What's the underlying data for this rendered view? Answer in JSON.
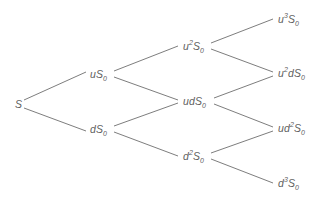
{
  "diagram": {
    "type": "tree",
    "background_color": "#ffffff",
    "edge_color": "#6e6e6e",
    "label_color": "#5e5e5e",
    "nodes": [
      {
        "id": "n0",
        "step": 0,
        "label": "S",
        "base": "S",
        "sup": "",
        "sub": "",
        "x": 15,
        "y": 104
      },
      {
        "id": "n1u",
        "step": 1,
        "label": "uS0",
        "base_italic": "u",
        "base": "S",
        "sup": "",
        "sub": "0",
        "x": 90,
        "y": 74
      },
      {
        "id": "n1d",
        "step": 1,
        "label": "dS0",
        "base_italic": "d",
        "base": "S",
        "sup": "",
        "sub": "0",
        "x": 90,
        "y": 129
      },
      {
        "id": "n2uu",
        "step": 2,
        "label": "u2S0",
        "base_italic": "u",
        "base": "S",
        "sup": "2",
        "sub": "0",
        "x": 183,
        "y": 46
      },
      {
        "id": "n2ud",
        "step": 2,
        "label": "udS0",
        "base_italic": "ud",
        "base": "S",
        "sup": "",
        "sub": "0",
        "x": 183,
        "y": 101
      },
      {
        "id": "n2dd",
        "step": 2,
        "label": "d2S0",
        "base_italic": "d",
        "base": "S",
        "sup": "2",
        "sub": "0",
        "x": 183,
        "y": 156
      },
      {
        "id": "n3uuu",
        "step": 3,
        "label": "u3S0",
        "base_italic": "u",
        "base": "S",
        "sup": "3",
        "sub": "0",
        "x": 278,
        "y": 19
      },
      {
        "id": "n3uud",
        "step": 3,
        "label": "u2dS0",
        "base_italic": "u",
        "base": "S",
        "sup": "2",
        "sub": "0",
        "x": 278,
        "y": 73
      },
      {
        "id": "n3udd",
        "step": 3,
        "label": "ud2S0",
        "base_italic": "u",
        "base": "S",
        "sup": "2",
        "sub": "0",
        "x": 278,
        "y": 128
      },
      {
        "id": "n3ddd",
        "step": 3,
        "label": "d3S0",
        "base_italic": "d",
        "base": "S",
        "sup": "3",
        "sub": "0",
        "x": 278,
        "y": 183
      }
    ],
    "labels": {
      "n0": {
        "parts": [
          {
            "t": "S",
            "k": "base"
          }
        ]
      },
      "n1u": {
        "parts": [
          {
            "t": "u",
            "k": "base"
          },
          {
            "t": "S",
            "k": "base"
          },
          {
            "t": "0",
            "k": "sub"
          }
        ]
      },
      "n1d": {
        "parts": [
          {
            "t": "d",
            "k": "base"
          },
          {
            "t": "S",
            "k": "base"
          },
          {
            "t": "0",
            "k": "sub"
          }
        ]
      },
      "n2uu": {
        "parts": [
          {
            "t": "u",
            "k": "base"
          },
          {
            "t": "2",
            "k": "sup"
          },
          {
            "t": "S",
            "k": "base"
          },
          {
            "t": "0",
            "k": "sub"
          }
        ]
      },
      "n2ud": {
        "parts": [
          {
            "t": "ud",
            "k": "base"
          },
          {
            "t": "S",
            "k": "base"
          },
          {
            "t": "0",
            "k": "sub"
          }
        ]
      },
      "n2dd": {
        "parts": [
          {
            "t": "d",
            "k": "base"
          },
          {
            "t": "2",
            "k": "sup"
          },
          {
            "t": "S",
            "k": "base"
          },
          {
            "t": "0",
            "k": "sub"
          }
        ]
      },
      "n3uuu": {
        "parts": [
          {
            "t": "u",
            "k": "base"
          },
          {
            "t": "3",
            "k": "sup"
          },
          {
            "t": "S",
            "k": "base"
          },
          {
            "t": "0",
            "k": "sub"
          }
        ]
      },
      "n3uud": {
        "parts": [
          {
            "t": "u",
            "k": "base"
          },
          {
            "t": "2",
            "k": "sup"
          },
          {
            "t": "d",
            "k": "base"
          },
          {
            "t": "S",
            "k": "base"
          },
          {
            "t": "0",
            "k": "sub"
          }
        ]
      },
      "n3udd": {
        "parts": [
          {
            "t": "ud",
            "k": "base"
          },
          {
            "t": "2",
            "k": "sup"
          },
          {
            "t": "S",
            "k": "base"
          },
          {
            "t": "0",
            "k": "sub"
          }
        ]
      },
      "n3ddd": {
        "parts": [
          {
            "t": "d",
            "k": "base"
          },
          {
            "t": "3",
            "k": "sup"
          },
          {
            "t": "S",
            "k": "base"
          },
          {
            "t": "0",
            "k": "sub"
          }
        ]
      }
    },
    "edges": [
      {
        "from": "n0",
        "to": "n1u",
        "x1": 24,
        "y1": 100,
        "x2": 86,
        "y2": 72
      },
      {
        "from": "n0",
        "to": "n1d",
        "x1": 24,
        "y1": 108,
        "x2": 86,
        "y2": 131
      },
      {
        "from": "n1u",
        "to": "n2uu",
        "x1": 114,
        "y1": 71,
        "x2": 178,
        "y2": 46
      },
      {
        "from": "n1u",
        "to": "n2ud",
        "x1": 114,
        "y1": 77,
        "x2": 178,
        "y2": 100
      },
      {
        "from": "n1d",
        "to": "n2ud",
        "x1": 114,
        "y1": 126,
        "x2": 178,
        "y2": 103
      },
      {
        "from": "n1d",
        "to": "n2dd",
        "x1": 114,
        "y1": 132,
        "x2": 178,
        "y2": 156
      },
      {
        "from": "n2uu",
        "to": "n3uuu",
        "x1": 211,
        "y1": 43,
        "x2": 273,
        "y2": 19
      },
      {
        "from": "n2uu",
        "to": "n3uud",
        "x1": 211,
        "y1": 49,
        "x2": 273,
        "y2": 72
      },
      {
        "from": "n2ud",
        "to": "n3uud",
        "x1": 214,
        "y1": 98,
        "x2": 273,
        "y2": 76
      },
      {
        "from": "n2ud",
        "to": "n3udd",
        "x1": 214,
        "y1": 104,
        "x2": 273,
        "y2": 127
      },
      {
        "from": "n2dd",
        "to": "n3udd",
        "x1": 211,
        "y1": 153,
        "x2": 273,
        "y2": 131
      },
      {
        "from": "n2dd",
        "to": "n3ddd",
        "x1": 211,
        "y1": 159,
        "x2": 273,
        "y2": 183
      }
    ]
  }
}
